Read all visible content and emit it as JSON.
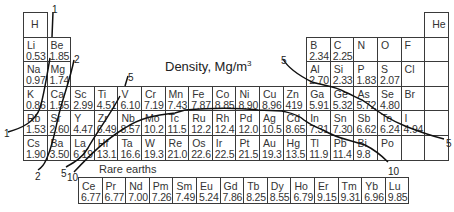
{
  "title": {
    "text": "Density, Mg/m",
    "sup": "3"
  },
  "rare_earths_label": "Rare earths",
  "colors": {
    "border": "#3a3a3a",
    "curve": "#111111",
    "text": "#333333"
  },
  "grid": {
    "x0": 23,
    "y0": 12,
    "cell_w": 23.6,
    "cell_h": 24.6
  },
  "elements": [
    {
      "sym": "H",
      "den": "",
      "row": 0,
      "col": 0
    },
    {
      "sym": "He",
      "den": "",
      "row": 0,
      "col": 17
    },
    {
      "sym": "Li",
      "den": "0.53",
      "row": 1,
      "col": 0
    },
    {
      "sym": "Be",
      "den": "1.85",
      "row": 1,
      "col": 1
    },
    {
      "sym": "B",
      "den": "2.34",
      "row": 1,
      "col": 12
    },
    {
      "sym": "C",
      "den": "2.25",
      "row": 1,
      "col": 13
    },
    {
      "sym": "N",
      "den": "",
      "row": 1,
      "col": 14
    },
    {
      "sym": "O",
      "den": "",
      "row": 1,
      "col": 15
    },
    {
      "sym": "F",
      "den": "",
      "row": 1,
      "col": 16
    },
    {
      "sym": "Na",
      "den": "0.97",
      "row": 2,
      "col": 0
    },
    {
      "sym": "Mg",
      "den": "1.74",
      "row": 2,
      "col": 1
    },
    {
      "sym": "Al",
      "den": "2.70",
      "row": 2,
      "col": 12
    },
    {
      "sym": "Si",
      "den": "2.33",
      "row": 2,
      "col": 13
    },
    {
      "sym": "P",
      "den": "1.83",
      "row": 2,
      "col": 14
    },
    {
      "sym": "S",
      "den": "2.07",
      "row": 2,
      "col": 15
    },
    {
      "sym": "Cl",
      "den": "",
      "row": 2,
      "col": 16
    },
    {
      "sym": "K",
      "den": "0.86",
      "row": 3,
      "col": 0
    },
    {
      "sym": "Ca",
      "den": "1.55",
      "row": 3,
      "col": 1
    },
    {
      "sym": "Sc",
      "den": "2.99",
      "row": 3,
      "col": 2
    },
    {
      "sym": "Ti",
      "den": "4.51",
      "row": 3,
      "col": 3
    },
    {
      "sym": "V",
      "den": "6.10",
      "row": 3,
      "col": 4
    },
    {
      "sym": "Cr",
      "den": "7.19",
      "row": 3,
      "col": 5
    },
    {
      "sym": "Mn",
      "den": "7.43",
      "row": 3,
      "col": 6
    },
    {
      "sym": "Fe",
      "den": "7.87",
      "row": 3,
      "col": 7
    },
    {
      "sym": "Co",
      "den": "8.85",
      "row": 3,
      "col": 8
    },
    {
      "sym": "Ni",
      "den": "8.90",
      "row": 3,
      "col": 9
    },
    {
      "sym": "Cu",
      "den": "8.96",
      "row": 3,
      "col": 10
    },
    {
      "sym": "Zn",
      "den": "419",
      "row": 3,
      "col": 11
    },
    {
      "sym": "Ga",
      "den": "5.91",
      "row": 3,
      "col": 12
    },
    {
      "sym": "Ge",
      "den": "5.32",
      "row": 3,
      "col": 13
    },
    {
      "sym": "As",
      "den": "5.72",
      "row": 3,
      "col": 14
    },
    {
      "sym": "Se",
      "den": "4.80",
      "row": 3,
      "col": 15
    },
    {
      "sym": "Br",
      "den": "",
      "row": 3,
      "col": 16
    },
    {
      "sym": "Rb",
      "den": "1.53",
      "row": 4,
      "col": 0
    },
    {
      "sym": "Sr",
      "den": "2.60",
      "row": 4,
      "col": 1
    },
    {
      "sym": "Y",
      "den": "4.47",
      "row": 4,
      "col": 2
    },
    {
      "sym": "Zr",
      "den": "6.49",
      "row": 4,
      "col": 3
    },
    {
      "sym": "Nb",
      "den": "8.57",
      "row": 4,
      "col": 4
    },
    {
      "sym": "Mo",
      "den": "10.2",
      "row": 4,
      "col": 5
    },
    {
      "sym": "Tc",
      "den": "11.5",
      "row": 4,
      "col": 6
    },
    {
      "sym": "Ru",
      "den": "12.2",
      "row": 4,
      "col": 7
    },
    {
      "sym": "Rh",
      "den": "12.4",
      "row": 4,
      "col": 8
    },
    {
      "sym": "Pd",
      "den": "12.0",
      "row": 4,
      "col": 9
    },
    {
      "sym": "Ag",
      "den": "10.5",
      "row": 4,
      "col": 10
    },
    {
      "sym": "Cd",
      "den": "8.65",
      "row": 4,
      "col": 11
    },
    {
      "sym": "In",
      "den": "7.31",
      "row": 4,
      "col": 12
    },
    {
      "sym": "Sn",
      "den": "7.30",
      "row": 4,
      "col": 13
    },
    {
      "sym": "Sb",
      "den": "6.62",
      "row": 4,
      "col": 14
    },
    {
      "sym": "Te",
      "den": "6.24",
      "row": 4,
      "col": 15
    },
    {
      "sym": "I",
      "den": "4.94",
      "row": 4,
      "col": 16
    },
    {
      "sym": "Cs",
      "den": "1.90",
      "row": 5,
      "col": 0
    },
    {
      "sym": "Ba",
      "den": "3.50",
      "row": 5,
      "col": 1
    },
    {
      "sym": "La",
      "den": "6.19",
      "row": 5,
      "col": 2
    },
    {
      "sym": "Hf",
      "den": "13.1",
      "row": 5,
      "col": 3
    },
    {
      "sym": "Ta",
      "den": "16.6",
      "row": 5,
      "col": 4
    },
    {
      "sym": "W",
      "den": "19.3",
      "row": 5,
      "col": 5
    },
    {
      "sym": "Re",
      "den": "21.0",
      "row": 5,
      "col": 6
    },
    {
      "sym": "Os",
      "den": "22.6",
      "row": 5,
      "col": 7
    },
    {
      "sym": "Ir",
      "den": "22.5",
      "row": 5,
      "col": 8
    },
    {
      "sym": "Pt",
      "den": "21.5",
      "row": 5,
      "col": 9
    },
    {
      "sym": "Au",
      "den": "19.3",
      "row": 5,
      "col": 10
    },
    {
      "sym": "Hg",
      "den": "13.5",
      "row": 5,
      "col": 11
    },
    {
      "sym": "Tl",
      "den": "11.9",
      "row": 5,
      "col": 12
    },
    {
      "sym": "Pb",
      "den": "11.4",
      "row": 5,
      "col": 13
    },
    {
      "sym": "Bi",
      "den": "9.8",
      "row": 5,
      "col": 14
    },
    {
      "sym": "Po",
      "den": "",
      "row": 5,
      "col": 15
    },
    {
      "sym": "",
      "den": "",
      "row": 5,
      "col": 16
    }
  ],
  "noble_column_cells": [
    {
      "row": 1,
      "col": 17
    },
    {
      "row": 2,
      "col": 17
    },
    {
      "row": 3,
      "col": 17
    },
    {
      "row": 4,
      "col": 17
    },
    {
      "row": 5,
      "col": 17
    }
  ],
  "rare_earths": {
    "x0": 78,
    "y0": 177,
    "cell_w": 23.6,
    "cell_h": 27,
    "items": [
      {
        "sym": "Ce",
        "den": "6.77"
      },
      {
        "sym": "Pr",
        "den": "6.77"
      },
      {
        "sym": "Nd",
        "den": "7.00"
      },
      {
        "sym": "Pm",
        "den": "7.26"
      },
      {
        "sym": "Sm",
        "den": "7.49"
      },
      {
        "sym": "Eu",
        "den": "5.24"
      },
      {
        "sym": "Gd",
        "den": "7.86"
      },
      {
        "sym": "Tb",
        "den": "8.25"
      },
      {
        "sym": "Dy",
        "den": "8.55"
      },
      {
        "sym": "Ho",
        "den": "6.79"
      },
      {
        "sym": "Er",
        "den": "9.15"
      },
      {
        "sym": "Tm",
        "den": "9.31"
      },
      {
        "sym": "Yb",
        "den": "6.96"
      },
      {
        "sym": "Lu",
        "den": "9.85"
      }
    ]
  },
  "contour_labels": [
    {
      "text": "1",
      "x": 52,
      "y": 4
    },
    {
      "text": "1",
      "x": 4,
      "y": 128
    },
    {
      "text": "2",
      "x": 74,
      "y": 54
    },
    {
      "text": "2",
      "x": 35,
      "y": 171
    },
    {
      "text": "5",
      "x": 128,
      "y": 72
    },
    {
      "text": "5",
      "x": 61,
      "y": 168
    },
    {
      "text": "5",
      "x": 281,
      "y": 55
    },
    {
      "text": "5",
      "x": 446,
      "y": 138
    },
    {
      "text": "10",
      "x": 67,
      "y": 172
    },
    {
      "text": "10",
      "x": 388,
      "y": 166
    }
  ]
}
